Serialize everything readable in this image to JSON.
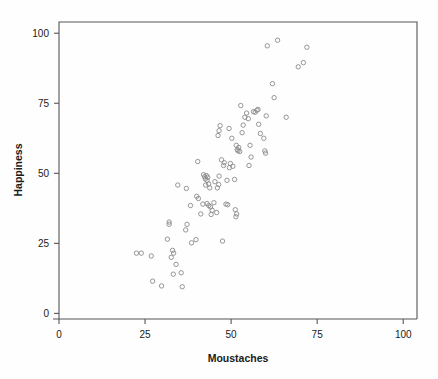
{
  "chart_data": {
    "type": "scatter",
    "title": "",
    "xlabel": "Moustaches",
    "ylabel": "Happiness",
    "xlim": [
      0,
      104
    ],
    "ylim": [
      -2,
      104
    ],
    "xticks": [
      0,
      25,
      50,
      75,
      100
    ],
    "yticks": [
      0,
      25,
      50,
      75,
      100
    ],
    "xtick_labels": [
      "0",
      "25",
      "50",
      "75",
      "100"
    ],
    "ytick_labels": [
      "0",
      "25",
      "50",
      "75",
      "100"
    ],
    "grid": false,
    "legend": null,
    "marker": {
      "shape": "open-circle",
      "radius_px": 2.2,
      "stroke_color": "#8a8a8a",
      "fill": "none"
    },
    "frame_color": "#555555",
    "background_color": "#fefefe",
    "series": [
      {
        "name": "observations",
        "points": [
          [
            22.5,
            21.5
          ],
          [
            23.9,
            21.5
          ],
          [
            26.8,
            20.5
          ],
          [
            27.2,
            11.5
          ],
          [
            29.8,
            9.8
          ],
          [
            32.0,
            31.8
          ],
          [
            32.0,
            32.6
          ],
          [
            31.5,
            26.5
          ],
          [
            32.6,
            20.0
          ],
          [
            33.0,
            22.5
          ],
          [
            33.3,
            21.5
          ],
          [
            33.2,
            14.0
          ],
          [
            34.0,
            17.5
          ],
          [
            35.5,
            14.5
          ],
          [
            35.8,
            9.5
          ],
          [
            34.5,
            45.8
          ],
          [
            37.0,
            44.6
          ],
          [
            36.8,
            29.8
          ],
          [
            37.2,
            31.8
          ],
          [
            38.2,
            38.5
          ],
          [
            38.5,
            25.2
          ],
          [
            39.8,
            26.3
          ],
          [
            40.3,
            54.2
          ],
          [
            40.0,
            41.8
          ],
          [
            40.5,
            41.0
          ],
          [
            41.2,
            35.5
          ],
          [
            41.8,
            39.0
          ],
          [
            42.0,
            49.5
          ],
          [
            42.3,
            48.8
          ],
          [
            42.5,
            48.0
          ],
          [
            42.8,
            49.2
          ],
          [
            43.0,
            47.5
          ],
          [
            43.2,
            48.6
          ],
          [
            42.6,
            45.8
          ],
          [
            43.5,
            46.2
          ],
          [
            43.8,
            44.8
          ],
          [
            43.0,
            39.2
          ],
          [
            43.5,
            38.5
          ],
          [
            44.0,
            38.0
          ],
          [
            44.5,
            36.8
          ],
          [
            44.2,
            35.3
          ],
          [
            45.3,
            47.0
          ],
          [
            45.0,
            39.5
          ],
          [
            45.8,
            36.0
          ],
          [
            46.5,
            49.0
          ],
          [
            46.4,
            46.0
          ],
          [
            46.0,
            44.8
          ],
          [
            46.2,
            63.5
          ],
          [
            46.8,
            67.0
          ],
          [
            46.5,
            65.2
          ],
          [
            47.2,
            54.8
          ],
          [
            47.8,
            52.8
          ],
          [
            48.0,
            53.8
          ],
          [
            47.5,
            25.8
          ],
          [
            48.5,
            39.0
          ],
          [
            49.0,
            38.8
          ],
          [
            48.8,
            47.5
          ],
          [
            49.5,
            52.0
          ],
          [
            49.8,
            53.5
          ],
          [
            49.4,
            66.0
          ],
          [
            50.2,
            62.5
          ],
          [
            50.5,
            52.5
          ],
          [
            51.0,
            47.8
          ],
          [
            51.5,
            60.0
          ],
          [
            51.8,
            58.5
          ],
          [
            52.0,
            58.0
          ],
          [
            52.2,
            59.2
          ],
          [
            52.5,
            57.8
          ],
          [
            51.2,
            37.0
          ],
          [
            51.4,
            34.5
          ],
          [
            51.6,
            35.5
          ],
          [
            52.8,
            74.2
          ],
          [
            53.5,
            67.2
          ],
          [
            53.2,
            64.5
          ],
          [
            54.0,
            70.0
          ],
          [
            54.5,
            71.5
          ],
          [
            55.0,
            69.5
          ],
          [
            55.5,
            60.0
          ],
          [
            55.8,
            55.8
          ],
          [
            55.2,
            52.8
          ],
          [
            56.5,
            72.0
          ],
          [
            57.0,
            71.8
          ],
          [
            57.5,
            72.5
          ],
          [
            57.8,
            72.8
          ],
          [
            58.0,
            67.5
          ],
          [
            58.5,
            64.2
          ],
          [
            59.5,
            62.5
          ],
          [
            59.8,
            58.0
          ],
          [
            60.0,
            57.2
          ],
          [
            60.2,
            70.5
          ],
          [
            60.5,
            95.5
          ],
          [
            62.0,
            82.0
          ],
          [
            62.5,
            77.0
          ],
          [
            63.5,
            97.5
          ],
          [
            66.0,
            70.0
          ],
          [
            69.5,
            88.0
          ],
          [
            71.0,
            89.5
          ],
          [
            72.0,
            95.0
          ]
        ]
      }
    ]
  },
  "figure": {
    "plot_area": {
      "left_px": 59,
      "top_px": 22,
      "right_px": 417,
      "bottom_px": 319
    }
  }
}
